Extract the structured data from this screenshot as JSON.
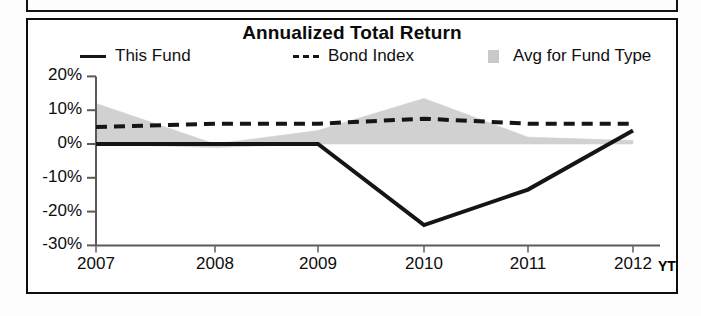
{
  "panel": {
    "title": "Annualized Total Return"
  },
  "legend": [
    {
      "label": "This Fund",
      "marker": "solid-line-swatch",
      "color": "#151515"
    },
    {
      "label": "Bond Index",
      "marker": "dashed-line-swatch",
      "color": "#151515"
    },
    {
      "label": "Avg for Fund Type",
      "marker": "area-swatch",
      "color": "#c9c9c9"
    }
  ],
  "axis": {
    "y_ticks": [
      "20%",
      "10%",
      "0%",
      "-10%",
      "-20%",
      "-30%"
    ],
    "x_ticks": [
      "2007",
      "2008",
      "2009",
      "2010",
      "2011",
      "2012"
    ],
    "ytd_suffix": "YT"
  },
  "chart_data": {
    "type": "line",
    "title": "Annualized Total Return",
    "xlabel": "",
    "ylabel": "",
    "ylim": [
      -30,
      20
    ],
    "ytick_step": 10,
    "grid": false,
    "legend_position": "top",
    "categories": [
      "2007",
      "2008",
      "2009",
      "2010",
      "2011",
      "2012"
    ],
    "x_note": "final category is 2012 YTD",
    "series": [
      {
        "name": "This Fund",
        "style": "solid",
        "color": "#151515",
        "values": [
          0,
          0,
          0,
          -24,
          -13.5,
          4
        ]
      },
      {
        "name": "Bond Index",
        "style": "dashed",
        "color": "#151515",
        "values": [
          5,
          6,
          6,
          7.5,
          6,
          6
        ]
      },
      {
        "name": "Avg for Fund Type",
        "style": "band",
        "color": "#c9c9c9",
        "band_upper": [
          12,
          0,
          4,
          13.5,
          2,
          1
        ],
        "band_lower": [
          0,
          -1,
          0,
          0,
          0,
          0
        ]
      }
    ]
  }
}
